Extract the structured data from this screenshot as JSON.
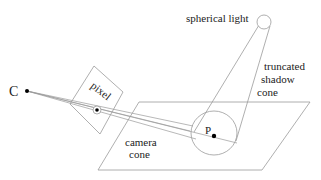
{
  "diagram": {
    "labels": {
      "camera": "C",
      "pixel": "pixel",
      "point": "P",
      "light": "spherical light",
      "shadow_cone_line1": "truncated",
      "shadow_cone_line2": "shadow",
      "shadow_cone_line3": "cone",
      "camera_cone_line1": "camera",
      "camera_cone_line2": "cone"
    },
    "colors": {
      "line": "#9a9a9a",
      "dot": "#000000",
      "text": "#222222"
    }
  }
}
